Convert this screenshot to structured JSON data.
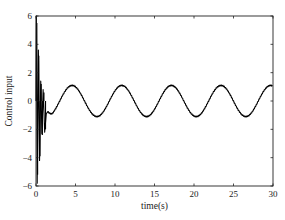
{
  "chart_data": {
    "type": "line",
    "title": "",
    "xlabel": "time(s)",
    "ylabel": "Control input",
    "xlim": [
      0,
      30
    ],
    "ylim": [
      -6,
      6
    ],
    "xticks": [
      0,
      5,
      10,
      15,
      20,
      25,
      30
    ],
    "yticks": [
      -6,
      -4,
      -2,
      0,
      2,
      4,
      6
    ],
    "grid": false,
    "legend": null,
    "series": [
      {
        "name": "Control input",
        "color": "#000000",
        "description": "Large oscillatory transient for t in [0, 1.5] with spikes reaching about +6 and -5.8, then settles to a sinusoid of amplitude about 1.1 and period about 6.3 s (approx 1.1*sin(t))",
        "transient_spikes": [
          {
            "t": 0.05,
            "value": 6.0
          },
          {
            "t": 0.15,
            "value": -5.8
          },
          {
            "t": 0.3,
            "value": 3.6
          },
          {
            "t": 0.45,
            "value": -4.2
          },
          {
            "t": 0.6,
            "value": 1.4
          },
          {
            "t": 0.75,
            "value": -2.3
          },
          {
            "t": 0.9,
            "value": 0.8
          },
          {
            "t": 1.1,
            "value": -2.2
          },
          {
            "t": 1.3,
            "value": -0.9
          },
          {
            "t": 1.5,
            "value": -0.75
          }
        ],
        "steady_state": {
          "amplitude": 1.1,
          "period": 6.28,
          "offset": 0,
          "phase_peak_times": [
            7.9,
            14.2,
            20.4,
            26.7
          ]
        }
      }
    ]
  }
}
